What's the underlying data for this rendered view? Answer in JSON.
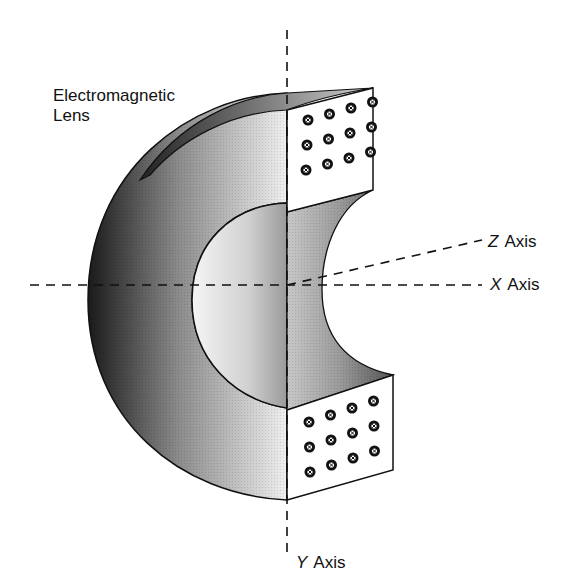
{
  "title": "Electromagnetic Lens",
  "labels": {
    "lens_line1": "Electromagnetic",
    "lens_line2": "Lens",
    "z_axis": {
      "letter": "Z",
      "word": "Axis"
    },
    "x_axis": {
      "letter": "X",
      "word": "Axis"
    },
    "y_axis": {
      "letter": "Y",
      "word": "Axis"
    }
  },
  "components": {
    "lens_body": "C-shaped toroidal segment, gradient shaded",
    "top_pole_face": {
      "coil_markers": 12,
      "rows": 3,
      "cols": 4,
      "marker": "cross-in-circle"
    },
    "bottom_pole_face": {
      "coil_markers": 12,
      "rows": 3,
      "cols": 4,
      "marker": "cross-in-circle"
    }
  },
  "colors": {
    "line": "#111111",
    "background": "#ffffff",
    "shade_dark": "#1a1a1a",
    "shade_light": "#f2f2f2"
  }
}
